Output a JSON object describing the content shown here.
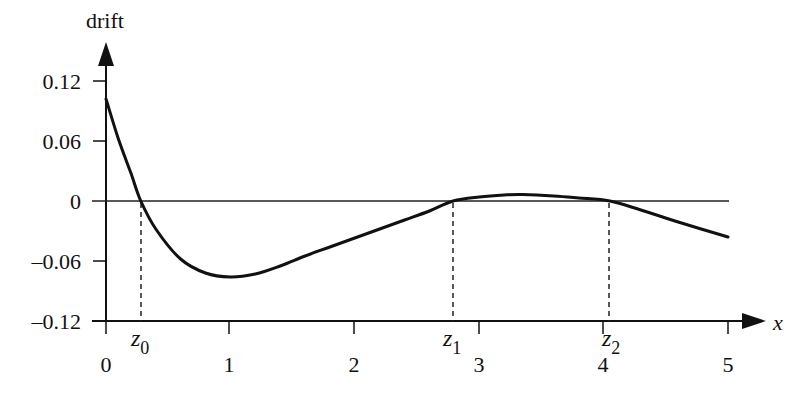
{
  "chart_data": {
    "type": "line",
    "title": "",
    "xlabel": "x",
    "ylabel": "drift",
    "xlim": [
      0,
      5
    ],
    "ylim": [
      -0.12,
      0.12
    ],
    "grid": false,
    "legend": null,
    "x_ticks": [
      0,
      1,
      2,
      3,
      4,
      5
    ],
    "x_tick_labels": [
      "0",
      "1",
      "2",
      "3",
      "4",
      "5"
    ],
    "y_ticks": [
      0.12,
      0.06,
      0,
      -0.06,
      -0.12
    ],
    "y_tick_labels": [
      "0.12",
      "0.06",
      "0",
      "–0.06",
      "–0.12"
    ],
    "series": [
      {
        "name": "drift",
        "x": [
          0,
          0.1,
          0.2,
          0.28,
          0.4,
          0.6,
          0.8,
          1.0,
          1.2,
          1.4,
          1.6,
          1.8,
          2.0,
          2.2,
          2.4,
          2.6,
          2.79,
          3.0,
          3.2,
          3.35,
          3.6,
          3.8,
          4.05,
          4.3,
          4.6,
          5.0
        ],
        "y": [
          0.102,
          0.062,
          0.028,
          0.0,
          -0.028,
          -0.058,
          -0.072,
          -0.076,
          -0.073,
          -0.065,
          -0.055,
          -0.046,
          -0.037,
          -0.028,
          -0.019,
          -0.01,
          0.0,
          0.004,
          0.006,
          0.0065,
          0.005,
          0.003,
          0.0,
          -0.009,
          -0.021,
          -0.036
        ]
      }
    ],
    "zero_line": {
      "y": 0,
      "x_range": [
        0,
        5
      ]
    },
    "annotations": [
      {
        "label": "z",
        "subscript": "0",
        "x": 0.28,
        "style": "dashed-vertical"
      },
      {
        "label": "z",
        "subscript": "1",
        "x": 2.79,
        "style": "dashed-vertical"
      },
      {
        "label": "z",
        "subscript": "2",
        "x": 4.05,
        "style": "dashed-vertical"
      }
    ]
  },
  "labels": {
    "y_axis_title": "drift",
    "x_axis_title": "x",
    "x_ticks": [
      "0",
      "1",
      "2",
      "3",
      "4",
      "5"
    ],
    "y_ticks": [
      "0.12",
      "0.06",
      "0",
      "–0.06",
      "–0.12"
    ],
    "markers": [
      {
        "base": "z",
        "sub": "0"
      },
      {
        "base": "z",
        "sub": "1"
      },
      {
        "base": "z",
        "sub": "2"
      }
    ]
  }
}
